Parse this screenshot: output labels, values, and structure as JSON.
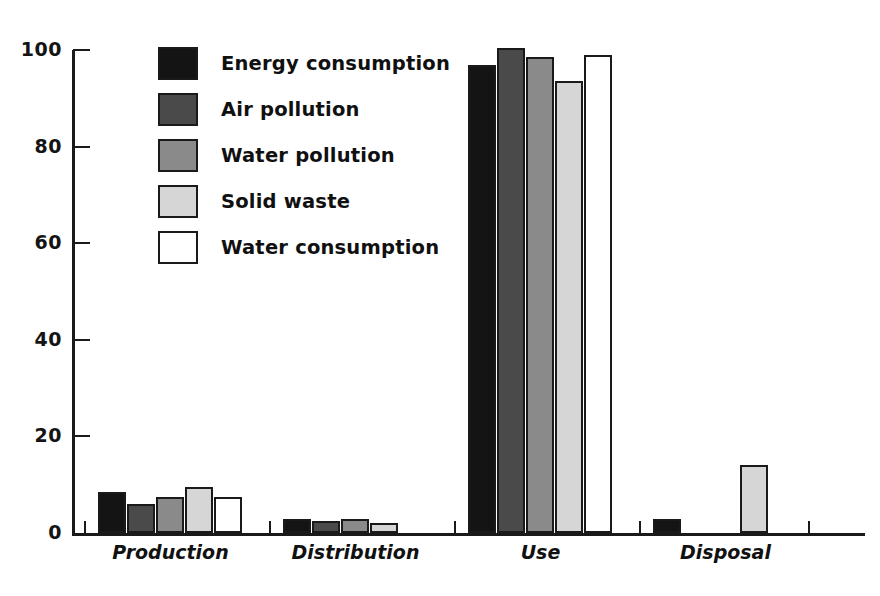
{
  "chart_data": {
    "type": "bar",
    "title": "",
    "subtitle": "",
    "xlabel": "",
    "ylabel": "",
    "categories": [
      "Production",
      "Distribution",
      "Use",
      "Disposal"
    ],
    "series": [
      {
        "name": "Energy consumption",
        "color": "#141414",
        "values": [
          8.5,
          3,
          97,
          3
        ]
      },
      {
        "name": "Air pollution",
        "color": "#4a4a4a",
        "values": [
          6,
          2.5,
          100.5,
          0
        ]
      },
      {
        "name": "Water pollution",
        "color": "#8a8a8a",
        "values": [
          7.5,
          3,
          98.5,
          0
        ]
      },
      {
        "name": "Solid waste",
        "color": "#d6d6d6",
        "values": [
          9.5,
          2,
          93.5,
          14
        ]
      },
      {
        "name": "Water consumption",
        "color": "#ffffff",
        "values": [
          7.5,
          0,
          99,
          0
        ]
      }
    ],
    "yticks": [
      0,
      20,
      40,
      60,
      80,
      100
    ],
    "ylim": [
      0,
      100
    ],
    "grid": false,
    "legend_position": "upper-left-inside",
    "bar_outline_color": "#1a1a1a"
  },
  "axis": {
    "y_tick_labels": [
      "100",
      "80",
      "60",
      "40",
      "20",
      "0"
    ]
  },
  "legend": {
    "entries": [
      {
        "label": "Energy consumption"
      },
      {
        "label": "Air pollution"
      },
      {
        "label": "Water pollution"
      },
      {
        "label": "Solid waste"
      },
      {
        "label": "Water consumption"
      }
    ]
  }
}
